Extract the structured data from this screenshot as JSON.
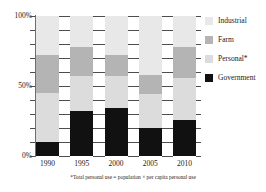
{
  "chart_data": {
    "type": "bar",
    "subtype": "100% stacked column",
    "title": "",
    "subtitle": "",
    "xlabel": "",
    "ylabel": "",
    "categories": [
      "1990",
      "1995",
      "2000",
      "2005",
      "2010"
    ],
    "series": [
      {
        "name": "Government",
        "color": "#111111",
        "values": [
          10,
          32,
          34,
          20,
          26
        ]
      },
      {
        "name": "Personal*",
        "color": "#dcdcdc",
        "values": [
          35,
          25,
          23,
          24,
          30
        ]
      },
      {
        "name": "Farm",
        "color": "#b4b4b4",
        "values": [
          27,
          21,
          15,
          14,
          22
        ]
      },
      {
        "name": "Industrial",
        "color": "#e8e8e8",
        "values": [
          28,
          22,
          28,
          42,
          22
        ]
      }
    ],
    "stack_order_bottom_to_top": [
      "Government",
      "Personal*",
      "Farm",
      "Industrial"
    ],
    "ylim": [
      0,
      100
    ],
    "y_ticks_major": [
      "0%",
      "50%",
      "100%"
    ],
    "y_tick_major_values": [
      0,
      50,
      100
    ],
    "y_tick_minor_values": [
      10,
      20,
      30,
      40,
      60,
      70,
      80,
      90
    ],
    "y_unit": "%",
    "grid": "minor dashes between columns",
    "legend_position": "right",
    "annotations": [
      "*Total personal use = population × per capita personal use"
    ]
  },
  "axis": {
    "y_labels": [
      {
        "text": "100%",
        "value": 100
      },
      {
        "text": "50%",
        "value": 50
      },
      {
        "text": "0%",
        "value": 0
      }
    ],
    "x_labels": [
      "1990",
      "1995",
      "2000",
      "2005",
      "2010"
    ]
  },
  "legend": {
    "items": [
      {
        "label": "Industrial",
        "swatch": "legend-swatch-industrial",
        "color": "#e8e8e8"
      },
      {
        "label": "Farm",
        "swatch": "legend-swatch-farm",
        "color": "#b4b4b4"
      },
      {
        "label": "Personal*",
        "swatch": "legend-swatch-personal",
        "color": "#dcdcdc"
      },
      {
        "label": "Government",
        "swatch": "legend-swatch-government",
        "color": "#111111"
      }
    ]
  },
  "footnote": {
    "text": "*Total personal use = population × per capita personal use"
  }
}
